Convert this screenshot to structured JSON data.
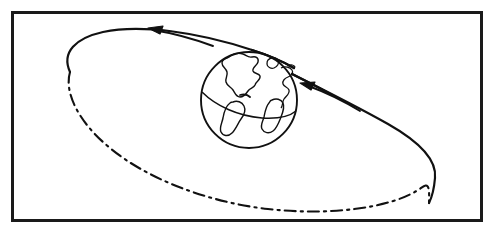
{
  "figure": {
    "title": "Earth with inclined elliptical orbit",
    "canvas": {
      "width": 494,
      "height": 233
    },
    "colors": {
      "ink": "#111111",
      "background": "#ffffff",
      "frame": "#1a1a1a"
    },
    "frame": {
      "name": "outer-border",
      "x": 11,
      "y": 11,
      "width": 472,
      "height": 211,
      "stroke_width": 3
    },
    "earth": {
      "label": "Earth",
      "center_x": 249,
      "center_y": 100,
      "radius": 48,
      "stroke_width": 1.6,
      "equator_label": "equator",
      "continents_label": "continent outlines"
    },
    "orbit": {
      "label": "orbital path",
      "center_x": 246,
      "center_y": 115,
      "semi_major": 182,
      "semi_minor": 62,
      "rotation_deg": 19,
      "near_style": "solid",
      "far_style": "dash-dot",
      "dash_pattern": "10 5 2 5",
      "stroke_width": 2.2
    },
    "arrows": [
      {
        "name": "orbit-direction-arrow-top",
        "direction": "leftward along upper orbit arc",
        "tip_x": 150,
        "tip_y": 29,
        "tail_x": 212,
        "tail_y": 46
      },
      {
        "name": "orbit-direction-arrow-right",
        "direction": "up-left toward the Earth along right orbit arc",
        "tip_x": 303,
        "tip_y": 84,
        "tail_x": 359,
        "tail_y": 110
      }
    ]
  }
}
